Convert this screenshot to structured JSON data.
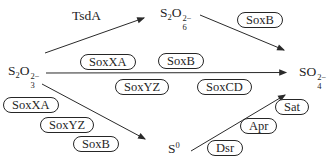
{
  "figure": {
    "background": "#ffffff",
    "ink": "#1f1f1f"
  },
  "nodes": {
    "s2o3": {
      "s": "S",
      "s_sub": "2",
      "o": "O",
      "o_sub": "3",
      "charge": "2−"
    },
    "s2o6": {
      "s": "S",
      "s_sub": "2",
      "o": "O",
      "o_sub": "6",
      "charge": "2−"
    },
    "so4": {
      "so": "SO",
      "o_sub": "4",
      "charge": "2−"
    },
    "s0": {
      "s": "S",
      "sup": "0"
    }
  },
  "enzymes": {
    "tsdA": "TsdA",
    "soxB_upper": "SoxB",
    "soxXA_above": "SoxXA",
    "soxB_above": "SoxB",
    "soxYZ_below": "SoxYZ",
    "soxCD_below": "SoxCD",
    "soxXA_lower": "SoxXA",
    "soxYZ_lower": "SoxYZ",
    "soxB_lower": "SoxB",
    "dsr": "Dsr",
    "apr": "Apr",
    "sat": "Sat"
  },
  "reactions": [
    {
      "from": "S2O3(2−)",
      "to": "S2O6(2−)",
      "enzymes": [
        "TsdA"
      ]
    },
    {
      "from": "S2O6(2−)",
      "to": "SO4(2−)",
      "enzymes": [
        "SoxB"
      ]
    },
    {
      "from": "S2O3(2−)",
      "to": "SO4(2−)",
      "enzymes": [
        "SoxXA",
        "SoxB",
        "SoxYZ",
        "SoxCD"
      ]
    },
    {
      "from": "S2O3(2−)",
      "to": "S0",
      "enzymes": [
        "SoxXA",
        "SoxYZ",
        "SoxB"
      ]
    },
    {
      "from": "S0",
      "to": "SO4(2−)",
      "enzymes": [
        "Dsr",
        "Apr",
        "Sat"
      ]
    }
  ]
}
